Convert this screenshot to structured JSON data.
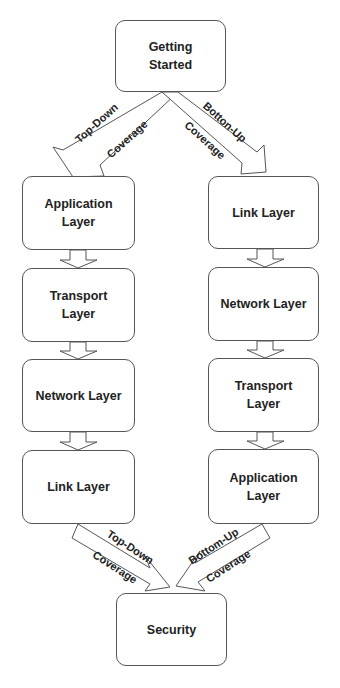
{
  "diagram": {
    "start": {
      "label": "Getting\nStarted"
    },
    "end": {
      "label": "Security"
    },
    "left_column": {
      "name": "Top-Down",
      "boxes": [
        {
          "label": "Application\nLayer"
        },
        {
          "label": "Transport\nLayer"
        },
        {
          "label": "Network Layer"
        },
        {
          "label": "Link Layer"
        }
      ]
    },
    "right_column": {
      "name": "Bottom-Up",
      "boxes": [
        {
          "label": "Link Layer"
        },
        {
          "label": "Network Layer"
        },
        {
          "label": "Transport\nLayer"
        },
        {
          "label": "Application\nLayer"
        }
      ]
    },
    "arrows": {
      "top_left": {
        "line1": "Top-Down",
        "line2": "Coverage"
      },
      "top_right": {
        "line1": "Botton-Up",
        "line2": "Coverage"
      },
      "bottom_left": {
        "line1": "Top-Down",
        "line2": "Coverage"
      },
      "bottom_right": {
        "line1": "Bottom-Up",
        "line2": "Coverage"
      }
    }
  }
}
